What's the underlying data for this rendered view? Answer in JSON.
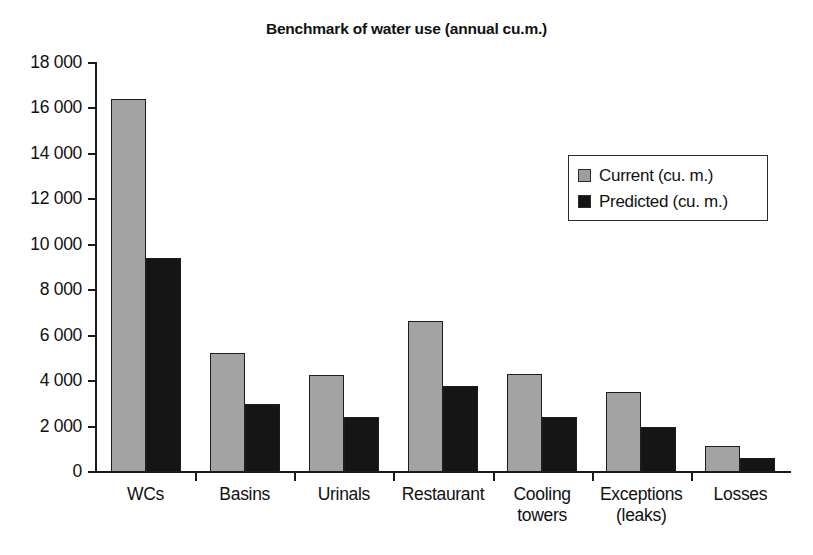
{
  "chart_data": {
    "type": "bar",
    "title": "Benchmark of water use (annual cu.m.)",
    "xlabel": "",
    "ylabel": "",
    "ylim": [
      0,
      18000
    ],
    "ytick_step": 2000,
    "ytick_labels": [
      "0",
      "2 000",
      "4 000",
      "6 000",
      "8 000",
      "10 000",
      "12 000",
      "14 000",
      "16 000",
      "18 000"
    ],
    "ytick_values": [
      0,
      2000,
      4000,
      6000,
      8000,
      10000,
      12000,
      14000,
      16000,
      18000
    ],
    "grid": false,
    "legend_position": "upper right inside",
    "categories": [
      "WCs",
      "Basins",
      "Urinals",
      "Restaurant",
      "Cooling\ntowers",
      "Exceptions\n(leaks)",
      "Losses"
    ],
    "series": [
      {
        "name": "Current (cu. m.)",
        "color": "#a3a3a3",
        "values": [
          16400,
          5250,
          4250,
          6650,
          4300,
          3500,
          1150
        ]
      },
      {
        "name": "Predicted (cu. m.)",
        "color": "#151515",
        "values": [
          9400,
          3000,
          2400,
          3800,
          2400,
          2000,
          600
        ]
      }
    ]
  },
  "legend": {
    "items": [
      {
        "label": "Current (cu. m.)",
        "swatch": "current"
      },
      {
        "label": "Predicted (cu. m.)",
        "swatch": "predicted"
      }
    ]
  },
  "colors": {
    "current_bar": "#a3a3a3",
    "predicted_bar": "#151515",
    "axis": "#1a1a1a",
    "text": "#111111",
    "background": "#ffffff"
  }
}
